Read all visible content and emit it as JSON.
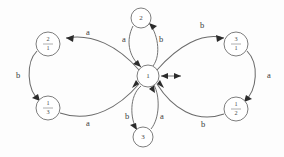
{
  "diagram": {
    "type": "state-transition-diagram",
    "title": "",
    "background_color": "#fdfdfd",
    "stroke_color": "#6b6b6b",
    "label_color": "#3a3a3a",
    "nodes": [
      {
        "id": "center",
        "label_kind": "single",
        "label": "1",
        "numerator": "1",
        "denominator": "",
        "cx": 148,
        "cy": 76,
        "r": 11
      },
      {
        "id": "top",
        "label_kind": "single",
        "label": "2",
        "numerator": "2",
        "denominator": "",
        "cx": 141,
        "cy": 18,
        "r": 10
      },
      {
        "id": "bottom",
        "label_kind": "single",
        "label": "3",
        "numerator": "3",
        "denominator": "",
        "cx": 143,
        "cy": 137,
        "r": 10
      },
      {
        "id": "top-left",
        "label_kind": "fraction",
        "label": "2/1",
        "numerator": "2",
        "denominator": "1",
        "cx": 48,
        "cy": 44,
        "r": 12
      },
      {
        "id": "bottom-left",
        "label_kind": "fraction",
        "label": "1/3",
        "numerator": "1",
        "denominator": "3",
        "cx": 48,
        "cy": 108,
        "r": 12
      },
      {
        "id": "top-right",
        "label_kind": "fraction",
        "label": "3/1",
        "numerator": "3",
        "denominator": "1",
        "cx": 236,
        "cy": 44,
        "r": 12
      },
      {
        "id": "bottom-right",
        "label_kind": "fraction",
        "label": "1/2",
        "numerator": "1",
        "denominator": "2",
        "cx": 236,
        "cy": 109,
        "r": 12
      }
    ],
    "edges": [
      {
        "id": "center-to-top-left",
        "from": "center",
        "to": "top-left",
        "label": "a",
        "label_x": 88,
        "label_y": 33
      },
      {
        "id": "top-left-to-bottom-left",
        "from": "top-left",
        "to": "bottom-left",
        "label": "b",
        "label_x": 18,
        "label_y": 76
      },
      {
        "id": "bottom-left-to-center",
        "from": "bottom-left",
        "to": "center",
        "label": "a",
        "label_x": 88,
        "label_y": 124
      },
      {
        "id": "center-to-top",
        "from": "top",
        "to": "center",
        "label": "a",
        "label_x": 124,
        "label_y": 40
      },
      {
        "id": "top-to-center",
        "from": "center",
        "to": "top",
        "label": "b",
        "label_x": 161,
        "label_y": 40
      },
      {
        "id": "bottom-to-center-b",
        "from": "center",
        "to": "bottom",
        "label": "b",
        "label_x": 127,
        "label_y": 117
      },
      {
        "id": "bottom-to-center-a",
        "from": "bottom",
        "to": "center",
        "label": "a",
        "label_x": 162,
        "label_y": 117
      },
      {
        "id": "center-to-top-right",
        "from": "center",
        "to": "top-right",
        "label": "b",
        "label_x": 202,
        "label_y": 26
      },
      {
        "id": "top-right-to-bottom-right",
        "from": "top-right",
        "to": "bottom-right",
        "label": "a",
        "label_x": 269,
        "label_y": 76
      },
      {
        "id": "bottom-right-to-center",
        "from": "bottom-right",
        "to": "center",
        "label": "b",
        "label_x": 203,
        "label_y": 125
      }
    ],
    "markers": [
      {
        "id": "center-double-arrow",
        "kind": "double-arrow",
        "x": 162,
        "y": 76,
        "length": 20
      }
    ]
  }
}
